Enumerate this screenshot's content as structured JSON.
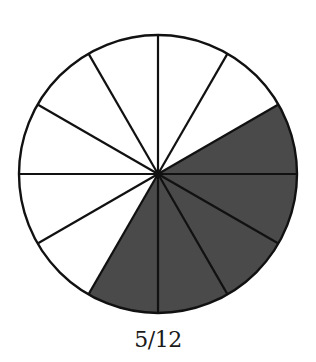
{
  "figure": {
    "caption": "5/12",
    "total_slices": 12,
    "shaded_slices": 5,
    "shaded_color": "#4a4a4a",
    "unshaded_color": "#ffffff",
    "stroke_color": "#111111"
  },
  "chart_data": {
    "type": "pie",
    "title": "5/12",
    "categories": [
      "shaded",
      "unshaded"
    ],
    "values": [
      5,
      7
    ],
    "slices": 12,
    "shaded_range_degrees_ccw_from_east": [
      -120,
      30
    ]
  }
}
